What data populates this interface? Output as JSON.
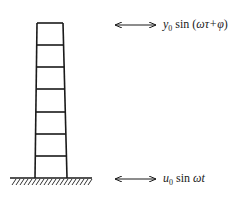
{
  "diagram": {
    "structure": {
      "type": "shear-frame",
      "storeys": 7,
      "top_y": 23,
      "ground_y": 178,
      "top_left_x": 37,
      "top_right_x": 63,
      "bottom_left_x": 35,
      "bottom_right_x": 67,
      "floor_ys": [
        23,
        45,
        67,
        89,
        112,
        134,
        156
      ]
    },
    "ground": {
      "x_start": 10,
      "x_end": 92,
      "hatch": true
    },
    "top_motion": {
      "arrow": "double-headed-arrow",
      "var": "y",
      "sub": "0",
      "fn": " sin (",
      "arg": "ωτ+φ",
      "close": ")"
    },
    "base_motion": {
      "arrow": "double-headed-arrow",
      "var": "u",
      "sub": "0",
      "fn": " sin ",
      "arg": "ωt"
    },
    "colors": {
      "line": "#1a1a1a",
      "background": "#ffffff"
    }
  }
}
